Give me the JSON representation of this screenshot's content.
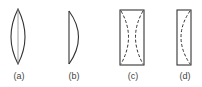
{
  "figures": [
    {
      "id": "a",
      "label": "(a)",
      "shape": "biconvex-lens"
    },
    {
      "id": "b",
      "label": "(b)",
      "shape": "plano-convex-lens"
    },
    {
      "id": "c",
      "label": "(c)",
      "shape": "rectangle-with-dashed-biconcave-curves"
    },
    {
      "id": "d",
      "label": "(d)",
      "shape": "rectangle-with-dashed-concave-curve"
    }
  ],
  "colors": {
    "stroke": "#333333",
    "background": "#ffffff"
  }
}
